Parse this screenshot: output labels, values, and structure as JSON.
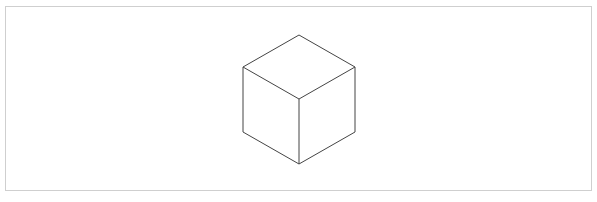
{
  "diagram": {
    "shape": "isometric-cube",
    "stroke_color": "#444444",
    "frame_color": "#cfcfcf",
    "vertices": {
      "top": [
        299,
        35
      ],
      "left_top": [
        243,
        67
      ],
      "right_top": [
        355,
        67
      ],
      "center": [
        299,
        99
      ],
      "left_bottom": [
        243,
        132
      ],
      "right_bottom": [
        355,
        132
      ],
      "bottom": [
        299,
        164
      ]
    }
  },
  "caption": ""
}
